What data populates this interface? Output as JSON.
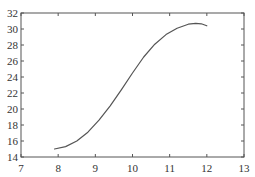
{
  "chart_data": {
    "type": "line",
    "title": "",
    "xlabel": "",
    "ylabel": "",
    "xlim": [
      7,
      13
    ],
    "ylim": [
      14,
      32
    ],
    "xticks": [
      "7",
      "8",
      "9",
      "10",
      "11",
      "12",
      "13"
    ],
    "yticks": [
      "14",
      "16",
      "18",
      "20",
      "22",
      "24",
      "26",
      "28",
      "30",
      "32"
    ],
    "grid": false,
    "legend": null,
    "series": [
      {
        "name": "curve",
        "color": "#555555",
        "x": [
          7.9,
          8.2,
          8.5,
          8.8,
          9.1,
          9.4,
          9.7,
          10.0,
          10.3,
          10.6,
          10.9,
          11.2,
          11.5,
          11.7,
          11.85,
          12.0
        ],
        "y": [
          15.0,
          15.3,
          16.0,
          17.1,
          18.6,
          20.4,
          22.4,
          24.5,
          26.5,
          28.1,
          29.3,
          30.1,
          30.6,
          30.7,
          30.65,
          30.4
        ]
      }
    ]
  }
}
